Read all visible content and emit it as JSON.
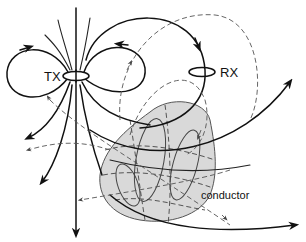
{
  "diagram": {
    "labels": {
      "transmitter": "TX",
      "receiver": "RX",
      "conductor": "conductor"
    },
    "colors": {
      "line": "#111111",
      "secondary_field": "#555555",
      "conductor_fill": "#d9d9d9",
      "conductor_stroke": "#555555",
      "background": "#ffffff"
    },
    "elements": {
      "transmitter_coil": "TX loop (ellipse) at left, with primary dipole field lines",
      "receiver_coil": "RX loop (ellipse) at right",
      "primary_field": "solid black arrowed field lines from TX",
      "secondary_field": "dashed gray arrowed field lines from induced currents",
      "conductor_body": "gray shaded body with eddy-current loops"
    }
  }
}
